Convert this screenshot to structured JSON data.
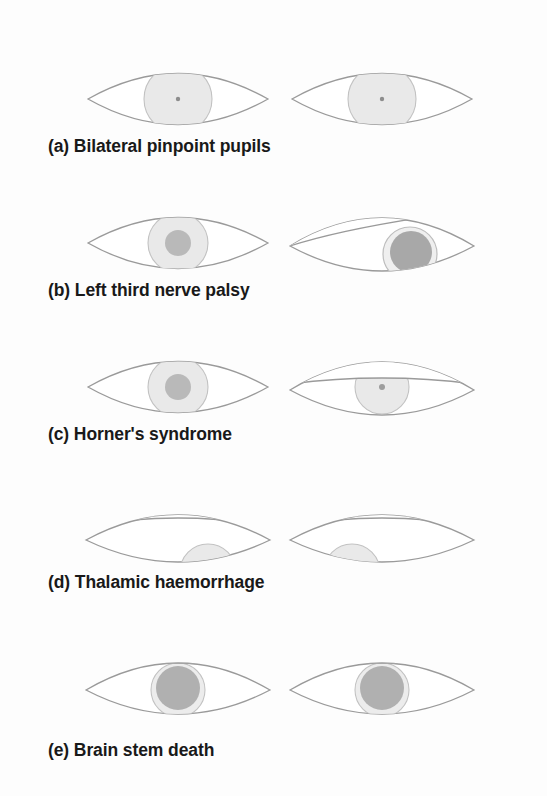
{
  "figure": {
    "background_color": "#fdfdfd",
    "ink_color": "#8a8a8a",
    "iris_fill": "#e8e8e8",
    "pupil_fill": "#b8b8b8",
    "pupil_dark_fill": "#9a9a9a",
    "text_color": "#191919",
    "panel_count": 5
  },
  "panels": [
    {
      "id": "a",
      "label": "(a) Bilateral pinpoint pupils",
      "label_y": 136,
      "eyes_y": 44,
      "left_eye": {
        "name": "left-eye-pinpoint",
        "lid_state": "open",
        "gaze": "central",
        "iris_radius": 34,
        "iris_cx": 100,
        "iris_cy": 55,
        "pupil_radius": 2,
        "pupil_tone": "pinpoint",
        "description": "Large pale iris with pinpoint pupil"
      },
      "right_eye": {
        "name": "right-eye-pinpoint",
        "lid_state": "open",
        "gaze": "central",
        "iris_radius": 34,
        "iris_cx": 100,
        "iris_cy": 55,
        "pupil_radius": 2,
        "pupil_tone": "pinpoint",
        "description": "Large pale iris with pinpoint pupil"
      }
    },
    {
      "id": "b",
      "label": "(b) Left third nerve palsy",
      "label_y": 280,
      "eyes_y": 188,
      "left_eye": {
        "name": "left-eye-normal",
        "lid_state": "open",
        "gaze": "central",
        "iris_radius": 30,
        "iris_cx": 100,
        "iris_cy": 55,
        "pupil_radius": 13,
        "pupil_tone": "mid",
        "description": "Normal eye, mid-sized reactive pupil"
      },
      "right_eye": {
        "name": "right-eye-third-nerve-palsy",
        "lid_state": "ptosis-partial",
        "gaze": "lateral-down",
        "iris_radius": 27,
        "iris_cx": 128,
        "iris_cy": 66,
        "pupil_radius": 21,
        "pupil_tone": "dark",
        "description": "Ptosis with dilated unreactive pupil, eye deviated down and out"
      }
    },
    {
      "id": "c",
      "label": "(c) Horner's syndrome",
      "label_y": 424,
      "eyes_y": 332,
      "left_eye": {
        "name": "left-eye-normal",
        "lid_state": "open",
        "gaze": "central",
        "iris_radius": 30,
        "iris_cx": 100,
        "iris_cy": 55,
        "pupil_radius": 13,
        "pupil_tone": "mid",
        "description": "Normal eye, mid-sized reactive pupil"
      },
      "right_eye": {
        "name": "right-eye-horner",
        "lid_state": "ptosis-half",
        "gaze": "central",
        "iris_radius": 27,
        "iris_cx": 100,
        "iris_cy": 55,
        "pupil_radius": 3,
        "pupil_tone": "small",
        "description": "Partial ptosis with small constricted pupil"
      }
    },
    {
      "id": "d",
      "label": "(d) Thalamic haemorrhage",
      "label_y": 572,
      "eyes_y": 484,
      "left_eye": {
        "name": "left-eye-downward-medial-gaze",
        "lid_state": "lid-retracted",
        "gaze": "down-and-in-right",
        "iris_radius": 28,
        "iris_cx": 128,
        "iris_cy": 84,
        "pupil_radius": 2,
        "pupil_tone": "pinpoint",
        "description": "Eyes deviated downward and medially, small pupils"
      },
      "right_eye": {
        "name": "right-eye-downward-medial-gaze",
        "lid_state": "lid-retracted",
        "gaze": "down-and-in-left",
        "iris_radius": 28,
        "iris_cx": 72,
        "iris_cy": 84,
        "pupil_radius": 2,
        "pupil_tone": "pinpoint",
        "description": "Eyes deviated downward and medially, small pupils"
      }
    },
    {
      "id": "e",
      "label": "(e) Brain stem death",
      "label_y": 740,
      "eyes_y": 632,
      "left_eye": {
        "name": "left-eye-fixed-dilated",
        "lid_state": "lid-fold",
        "gaze": "central",
        "iris_radius": 27,
        "iris_cx": 100,
        "iris_cy": 56,
        "pupil_radius": 22,
        "pupil_tone": "dark",
        "description": "Mid-position fixed dilated unreactive pupil"
      },
      "right_eye": {
        "name": "right-eye-fixed-dilated",
        "lid_state": "lid-fold",
        "gaze": "central",
        "iris_radius": 27,
        "iris_cx": 100,
        "iris_cy": 56,
        "pupil_radius": 22,
        "pupil_tone": "dark",
        "description": "Mid-position fixed dilated unreactive pupil"
      }
    }
  ]
}
